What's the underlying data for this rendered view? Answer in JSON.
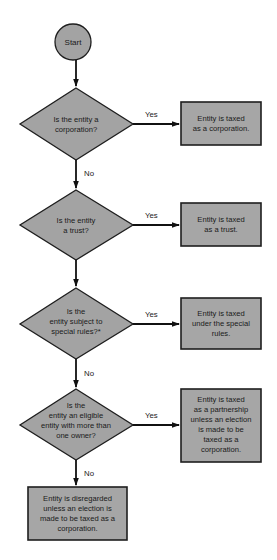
{
  "diagram": {
    "type": "flowchart",
    "colors": {
      "node_fill": "#a3a3a3",
      "box_fill": "#a6a6a6",
      "stroke": "#1e1e1e",
      "background": "#ffffff"
    },
    "start": {
      "label": "Start"
    },
    "decisions": [
      {
        "id": "q1",
        "lines": [
          "Is the entity a",
          "corporation?"
        ]
      },
      {
        "id": "q2",
        "lines": [
          "Is the entity",
          "a trust?"
        ]
      },
      {
        "id": "q3",
        "lines": [
          "Is the",
          "entity subject to",
          "special rules?*"
        ]
      },
      {
        "id": "q4",
        "lines": [
          "Is the",
          "entity an eligible",
          "entity with more than",
          "one owner?"
        ]
      }
    ],
    "outcomes": [
      {
        "id": "r1",
        "lines": [
          "Entity is taxed",
          "as a corporation."
        ]
      },
      {
        "id": "r2",
        "lines": [
          "Entity is taxed",
          "as a trust."
        ]
      },
      {
        "id": "r3",
        "lines": [
          "Entity is taxed",
          "under the special",
          "rules."
        ]
      },
      {
        "id": "r4",
        "lines": [
          "Entity is taxed",
          "as a partnership",
          "unless an election",
          "is made to be",
          "taxed as a",
          "corporation."
        ]
      },
      {
        "id": "r5",
        "lines": [
          "Entity is disregarded",
          "unless an election is",
          "made to be taxed as a",
          "corporation."
        ]
      }
    ],
    "edge_labels": {
      "q1_yes": "Yes",
      "q1_no": "No",
      "q2_yes": "Yes",
      "q3_yes": "Yes",
      "q3_no": "No",
      "q4_yes": "Yes",
      "q4_no": "No"
    }
  }
}
